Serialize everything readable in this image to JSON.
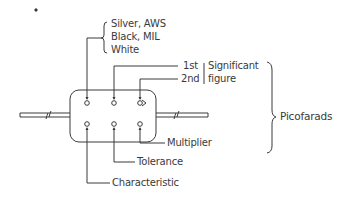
{
  "diagram": {
    "characteristic_group": {
      "items": [
        "Silver, AWS",
        "Black, MIL",
        "White"
      ]
    },
    "significant_figure": {
      "first": "1st",
      "second": "2nd",
      "label_line1": "Significant",
      "label_line2": "figure"
    },
    "unit_label": "Picofarads",
    "bottom_labels": {
      "multiplier": "Multiplier",
      "tolerance": "Tolerance",
      "characteristic": "Characteristic"
    },
    "colors": {
      "line": "#3a3a3a",
      "background": "#ffffff"
    }
  }
}
